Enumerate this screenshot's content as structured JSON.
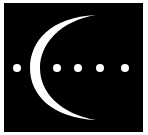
{
  "logo": {
    "background": "#000000",
    "foreground": "#ffffff",
    "frame_color": "#ffffff",
    "square": {
      "x": 4,
      "y": 3,
      "width": 139,
      "height": 129
    },
    "crescent": {
      "outer_path": "M96 15 C 50 17, 30 42, 30 68 C 30 95, 52 118, 96 120",
      "inner_path": "M96 120 C 60 114, 40 92, 40 68 C 40 44, 60 21, 96 15 Z"
    },
    "dots": [
      {
        "cx": 17,
        "cy": 68,
        "r": 4
      },
      {
        "cx": 57,
        "cy": 68,
        "r": 4
      },
      {
        "cx": 78,
        "cy": 68,
        "r": 4
      },
      {
        "cx": 100,
        "cy": 68,
        "r": 4
      },
      {
        "cx": 125,
        "cy": 68,
        "r": 4
      }
    ]
  }
}
